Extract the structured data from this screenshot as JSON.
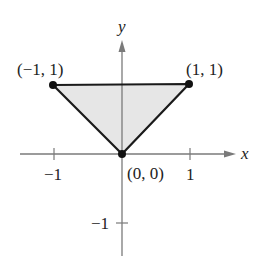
{
  "diagram": {
    "type": "coordinate-plane-triangle",
    "axes": {
      "x_label": "x",
      "y_label": "y",
      "x_ticks": [
        {
          "value": -1,
          "label": "−1"
        },
        {
          "value": 1,
          "label": "1"
        }
      ],
      "y_ticks": [
        {
          "value": -1,
          "label": "−1"
        }
      ]
    },
    "vertices": [
      {
        "x": -1,
        "y": 1,
        "label": "(−1, 1)"
      },
      {
        "x": 1,
        "y": 1,
        "label": "(1, 1)"
      },
      {
        "x": 0,
        "y": 0,
        "label": "(0, 0)"
      }
    ],
    "region": {
      "fill": "#e6e6e6",
      "stroke": "#1a1a1a"
    },
    "colors": {
      "axis": "#7a7a7a",
      "edge": "#1a1a1a",
      "point": "#111111"
    }
  }
}
